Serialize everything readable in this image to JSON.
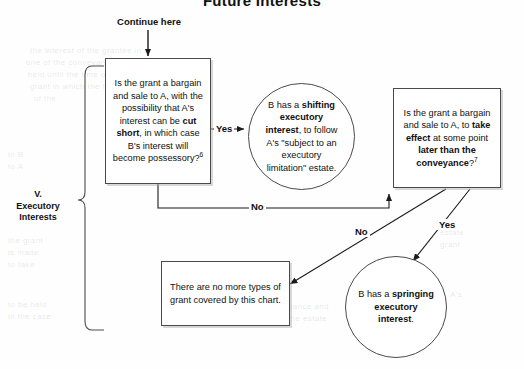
{
  "document": {
    "title": "Future Interests",
    "section_label": "V.\nExecutory\nInterests",
    "section_label_line1": "V.",
    "section_label_line2": "Executory",
    "section_label_line3": "Interests",
    "continue_label": "Continue here"
  },
  "nodes": {
    "decision1": {
      "id": "decision-bargain-sale-cut-short",
      "shape": "rectangle",
      "text_plain": "Is the grant a bargain and sale to A, with the possibility that A's interest can be cut short, in which case B's interest will become possessory? 6",
      "footnote": "6",
      "segments": [
        {
          "text": "Is the grant a bargain and sale to A, with the possibility that A's interest can be ",
          "bold": false
        },
        {
          "text": "cut short",
          "bold": true
        },
        {
          "text": ", in which case B's interest will become possessory?",
          "bold": false
        }
      ]
    },
    "outcome1": {
      "id": "outcome-shifting-executory-interest",
      "shape": "circle",
      "text_plain": "B has a shifting executory interest, to follow A's \"subject to an executory limitation\" estate.",
      "segments": [
        {
          "text": "B has a ",
          "bold": false
        },
        {
          "text": "shifting executory interest",
          "bold": true
        },
        {
          "text": ", to follow A's \"subject to an executory limitation\" estate.",
          "bold": false
        }
      ]
    },
    "decision2": {
      "id": "decision-bargain-sale-take-effect-later",
      "shape": "rectangle",
      "text_plain": "Is the grant a bargain and sale to A, to take effect at some point later than the conveyance? 7",
      "footnote": "7",
      "segments": [
        {
          "text": "Is the grant a bargain and sale to A, to ",
          "bold": false
        },
        {
          "text": "take effect",
          "bold": true
        },
        {
          "text": " at some point ",
          "bold": false
        },
        {
          "text": "later than the conveyance",
          "bold": true
        },
        {
          "text": "?",
          "bold": false
        }
      ]
    },
    "outcome2": {
      "id": "outcome-springing-executory-interest",
      "shape": "circle",
      "text_plain": "B has a springing executory interest.",
      "segments": [
        {
          "text": "B has a ",
          "bold": false
        },
        {
          "text": "springing executory interest",
          "bold": true
        },
        {
          "text": ".",
          "bold": false
        }
      ]
    },
    "terminal": {
      "id": "terminal-no-more-types",
      "shape": "rectangle",
      "text_plain": "There are no more types of grant covered by this chart.",
      "segments": [
        {
          "text": "There are no more types of grant covered by this chart.",
          "bold": false
        }
      ]
    }
  },
  "edges": [
    {
      "id": "edge-decision1-yes",
      "label": "Yes",
      "from": "decision1",
      "to": "outcome1"
    },
    {
      "id": "edge-decision1-no",
      "label": "No",
      "from": "decision1",
      "to": "decision2"
    },
    {
      "id": "edge-decision2-no",
      "label": "No",
      "from": "decision2",
      "to": "terminal"
    },
    {
      "id": "edge-decision2-yes",
      "label": "Yes",
      "from": "decision2",
      "to": "outcome2"
    }
  ],
  "edge_labels": {
    "yes1": "Yes",
    "no1": "No",
    "no2": "No",
    "yes2": "Yes"
  },
  "colors": {
    "ink": "#111111",
    "stroke": "#4a4a4a",
    "paper": "#fefefe",
    "shadow": "#aaaaaa"
  }
}
